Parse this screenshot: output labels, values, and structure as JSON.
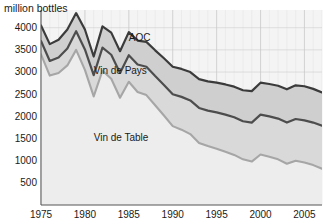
{
  "chart_data": {
    "type": "area",
    "title": "",
    "subtitle": "",
    "ylabel": "million bottles",
    "xlabel": "",
    "stacked": true,
    "grid": true,
    "legend_position": "inline-annotations",
    "xlim": [
      1975,
      2007
    ],
    "ylim": [
      0,
      4400
    ],
    "y_ticks": [
      500,
      1000,
      1500,
      2000,
      2500,
      3000,
      3500,
      4000
    ],
    "y_tick_labels": [
      "500",
      "1000",
      "1500",
      "2000",
      "2500",
      "3000",
      "3500",
      "4000"
    ],
    "x_ticks": [
      1975,
      1980,
      1985,
      1990,
      1995,
      2000,
      2005
    ],
    "x_tick_labels": [
      "1975",
      "1980",
      "1985",
      "1990",
      "1995",
      "2000",
      "2005"
    ],
    "x": [
      1975,
      1976,
      1977,
      1978,
      1979,
      1980,
      1981,
      1982,
      1983,
      1984,
      1985,
      1986,
      1987,
      1988,
      1989,
      1990,
      1991,
      1992,
      1993,
      1994,
      1995,
      1996,
      1997,
      1998,
      1999,
      2000,
      2001,
      2002,
      2003,
      2004,
      2005,
      2006,
      2007
    ],
    "series": [
      {
        "name": "Vin de Table",
        "color": "#d4d4d4",
        "line_color": "#a8a8a8",
        "values": [
          3400,
          2920,
          2980,
          3150,
          3500,
          3050,
          2450,
          3030,
          2850,
          2420,
          2780,
          2550,
          2480,
          2250,
          2020,
          1780,
          1700,
          1600,
          1400,
          1330,
          1270,
          1200,
          1130,
          1030,
          980,
          1140,
          1090,
          1030,
          930,
          1000,
          960,
          900,
          820
        ]
      },
      {
        "name": "Vin de Pays",
        "color": "#c2c2c2",
        "line_color": "#4a4a4a",
        "values": [
          300,
          330,
          350,
          380,
          420,
          460,
          480,
          520,
          540,
          560,
          600,
          620,
          640,
          660,
          690,
          720,
          740,
          760,
          790,
          800,
          820,
          840,
          850,
          860,
          880,
          900,
          910,
          920,
          930,
          940,
          950,
          960,
          970
        ]
      },
      {
        "name": "AOC",
        "color": "#bdbdbd",
        "line_color": "#3a3a3a",
        "values": [
          350,
          380,
          400,
          430,
          410,
          450,
          420,
          480,
          500,
          490,
          520,
          540,
          560,
          580,
          600,
          620,
          630,
          640,
          650,
          660,
          670,
          680,
          690,
          700,
          710,
          720,
          730,
          740,
          750,
          760,
          770,
          760,
          750
        ]
      }
    ],
    "cumulative_totals": {
      "vin_de_table": [
        3400,
        2920,
        2980,
        3150,
        3500,
        3050,
        2450,
        3030,
        2850,
        2420,
        2780,
        2550,
        2480,
        2250,
        2020,
        1780,
        1700,
        1600,
        1400,
        1330,
        1270,
        1200,
        1130,
        1030,
        980,
        1140,
        1090,
        1030,
        930,
        1000,
        960,
        900,
        820
      ],
      "vin_de_table_plus_pays": [
        3700,
        3250,
        3330,
        3530,
        3920,
        3510,
        2930,
        3550,
        3390,
        2980,
        3380,
        3170,
        3120,
        2910,
        2710,
        2500,
        2440,
        2360,
        2190,
        2130,
        2090,
        2040,
        1980,
        1890,
        1860,
        2040,
        2000,
        1950,
        1860,
        1940,
        1910,
        1860,
        1790
      ],
      "total_all": [
        4050,
        3630,
        3730,
        3960,
        4330,
        3960,
        3350,
        4030,
        3890,
        3470,
        3900,
        3710,
        3680,
        3490,
        3310,
        3120,
        3070,
        3000,
        2840,
        2790,
        2760,
        2720,
        2670,
        2590,
        2570,
        2760,
        2730,
        2690,
        2610,
        2700,
        2680,
        2620,
        2540
      ]
    },
    "annotations": [
      {
        "name": "AOC",
        "label": "AOC",
        "x": 1985.0,
        "y": 3700
      },
      {
        "name": "Vin de Pays",
        "label": "Vin de Pays",
        "x": 1981.0,
        "y": 2950
      },
      {
        "name": "Vin de Table",
        "label": "Vin de Table",
        "x": 1981.0,
        "y": 1450
      }
    ]
  },
  "axis": {
    "y_title": "million bottles",
    "y_ticks": [
      "4000",
      "3500",
      "3000",
      "2500",
      "2000",
      "1500",
      "1000",
      "500"
    ],
    "x_ticks": [
      "1975",
      "1980",
      "1985",
      "1990",
      "1995",
      "2000",
      "2005"
    ]
  },
  "annotations": {
    "aoc": "AOC",
    "vin_de_pays": "Vin de Pays",
    "vin_de_table": "Vin de Table"
  },
  "colors": {
    "background": "#ffffff",
    "plot_background": "#f4f4f4",
    "grid": "#c9c9c9",
    "axis": "#555555",
    "band_table_fill": "#ededed",
    "band_table_line": "#a6a6a6",
    "band_pays_fill": "#d9d9d9",
    "band_pays_line": "#4d4d4d",
    "band_aoc_fill": "#cfcfcf",
    "band_aoc_line": "#3b3b3b",
    "text": "#1a1a1a"
  }
}
